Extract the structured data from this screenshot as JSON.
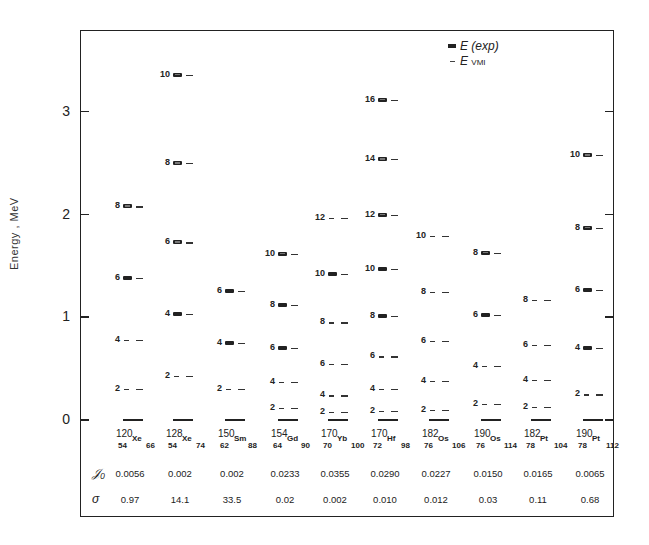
{
  "chart_data": {
    "type": "scatter",
    "subtype": "energy-level-diagram",
    "title": "",
    "xlabel": "",
    "ylabel": "Energy , MeV",
    "ylim": [
      0,
      3.6
    ],
    "yticks": [
      0,
      1,
      2,
      3
    ],
    "grid": false,
    "legend": {
      "position": "top-right",
      "entries": [
        {
          "symbol": "filled-box",
          "label": "E (exp)"
        },
        {
          "symbol": "dash",
          "label": "E VMI",
          "label_main": "E",
          "label_sub": "VMI"
        }
      ]
    },
    "nuclei": [
      {
        "A": "120",
        "Z": "54",
        "sym": "Xe",
        "N": "66",
        "g0": "0.0056",
        "sigma": "0.97",
        "levels": [
          {
            "J": 2,
            "E": 0.3,
            "exp": false
          },
          {
            "J": 4,
            "E": 0.78,
            "exp": false
          },
          {
            "J": 6,
            "E": 1.38,
            "exp": true
          },
          {
            "J": 8,
            "E": 2.08,
            "exp": true
          }
        ]
      },
      {
        "A": "128",
        "Z": "54",
        "sym": "Xe",
        "N": "74",
        "g0": "0.002",
        "sigma": "14.1",
        "levels": [
          {
            "J": 2,
            "E": 0.43,
            "exp": false
          },
          {
            "J": 4,
            "E": 1.03,
            "exp": true
          },
          {
            "J": 6,
            "E": 1.73,
            "exp": true
          },
          {
            "J": 8,
            "E": 2.5,
            "exp": true
          },
          {
            "J": 10,
            "E": 3.36,
            "exp": true
          }
        ]
      },
      {
        "A": "150",
        "Z": "62",
        "sym": "Sm",
        "N": "88",
        "g0": "0.002",
        "sigma": "33.5",
        "levels": [
          {
            "J": 2,
            "E": 0.3,
            "exp": false
          },
          {
            "J": 4,
            "E": 0.75,
            "exp": true
          },
          {
            "J": 6,
            "E": 1.26,
            "exp": true
          }
        ]
      },
      {
        "A": "154",
        "Z": "64",
        "sym": "Gd",
        "N": "90",
        "g0": "0.0233",
        "sigma": "0.02",
        "levels": [
          {
            "J": 2,
            "E": 0.12,
            "exp": false
          },
          {
            "J": 4,
            "E": 0.37,
            "exp": false
          },
          {
            "J": 6,
            "E": 0.7,
            "exp": true
          },
          {
            "J": 8,
            "E": 1.12,
            "exp": true
          },
          {
            "J": 10,
            "E": 1.62,
            "exp": true
          }
        ]
      },
      {
        "A": "170",
        "Z": "70",
        "sym": "Yb",
        "N": "100",
        "g0": "0.0355",
        "sigma": "0.002",
        "levels": [
          {
            "J": 2,
            "E": 0.08,
            "exp": false
          },
          {
            "J": 4,
            "E": 0.24,
            "exp": false
          },
          {
            "J": 6,
            "E": 0.55,
            "exp": false
          },
          {
            "J": 8,
            "E": 0.95,
            "exp": false
          },
          {
            "J": 10,
            "E": 1.42,
            "exp": true
          },
          {
            "J": 12,
            "E": 1.97,
            "exp": false
          }
        ]
      },
      {
        "A": "170",
        "Z": "72",
        "sym": "Hf",
        "N": "98",
        "g0": "0.0290",
        "sigma": "0.010",
        "levels": [
          {
            "J": 2,
            "E": 0.09,
            "exp": false
          },
          {
            "J": 4,
            "E": 0.3,
            "exp": false
          },
          {
            "J": 6,
            "E": 0.62,
            "exp": false
          },
          {
            "J": 8,
            "E": 1.01,
            "exp": true
          },
          {
            "J": 10,
            "E": 1.47,
            "exp": true
          },
          {
            "J": 12,
            "E": 2.0,
            "exp": true
          },
          {
            "J": 14,
            "E": 2.54,
            "exp": true
          },
          {
            "J": 16,
            "E": 3.12,
            "exp": true
          }
        ]
      },
      {
        "A": "182",
        "Z": "76",
        "sym": "Os",
        "N": "106",
        "g0": "0.0227",
        "sigma": "0.012",
        "levels": [
          {
            "J": 2,
            "E": 0.1,
            "exp": false
          },
          {
            "J": 4,
            "E": 0.38,
            "exp": false
          },
          {
            "J": 6,
            "E": 0.77,
            "exp": false
          },
          {
            "J": 8,
            "E": 1.25,
            "exp": false
          },
          {
            "J": 10,
            "E": 1.79,
            "exp": false
          }
        ]
      },
      {
        "A": "190",
        "Z": "76",
        "sym": "Os",
        "N": "114",
        "g0": "0.0150",
        "sigma": "0.03",
        "levels": [
          {
            "J": 2,
            "E": 0.16,
            "exp": false
          },
          {
            "J": 4,
            "E": 0.53,
            "exp": false
          },
          {
            "J": 6,
            "E": 1.02,
            "exp": true
          },
          {
            "J": 8,
            "E": 1.63,
            "exp": true
          }
        ]
      },
      {
        "A": "182",
        "Z": "78",
        "sym": "Pt",
        "N": "104",
        "g0": "0.0165",
        "sigma": "0.11",
        "levels": [
          {
            "J": 2,
            "E": 0.13,
            "exp": false
          },
          {
            "J": 4,
            "E": 0.39,
            "exp": false
          },
          {
            "J": 6,
            "E": 0.73,
            "exp": false
          },
          {
            "J": 8,
            "E": 1.17,
            "exp": false
          }
        ]
      },
      {
        "A": "190",
        "Z": "78",
        "sym": "Pt",
        "N": "112",
        "g0": "0.0065",
        "sigma": "0.68",
        "levels": [
          {
            "J": 2,
            "E": 0.25,
            "exp": false
          },
          {
            "J": 4,
            "E": 0.7,
            "exp": true
          },
          {
            "J": 6,
            "E": 1.27,
            "exp": true
          },
          {
            "J": 8,
            "E": 1.87,
            "exp": true
          },
          {
            "J": 10,
            "E": 2.58,
            "exp": true
          }
        ]
      }
    ],
    "table_rows": [
      {
        "label": "g0",
        "key": "g0"
      },
      {
        "label": "σ",
        "key": "sigma"
      }
    ]
  },
  "axis": {
    "ylabel": "Energy , MeV",
    "yticks": [
      "0",
      "1",
      "2",
      "3"
    ]
  },
  "legend": {
    "exp_label": "E (exp)",
    "vmi_main": "E",
    "vmi_sub": "VMI"
  },
  "table": {
    "g0_label": "𝒥₀",
    "sigma_label": "σ"
  }
}
